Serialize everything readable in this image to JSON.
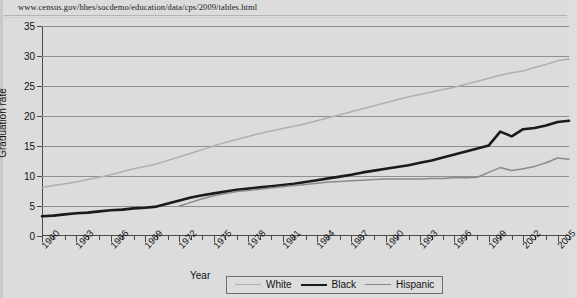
{
  "page": {
    "source_url": "www.census.gov/hhes/socdemo/education/data/cps/2009/tables.html"
  },
  "legend": {
    "white_label": "White",
    "black_label": "Black",
    "hispanic_label": "Hispanic"
  },
  "colors": {
    "white_series": "#b0b0b0",
    "black_series": "#1a1a1a",
    "hispanic_series": "#8a8a8a",
    "gridline": "#8f8f8f",
    "axis": "#4a4a4a",
    "background": "#dcdcdc"
  },
  "chart_data": {
    "type": "line",
    "title": "",
    "xlabel": "Year",
    "ylabel": "Graduation rate",
    "xlim": [
      1960,
      2006
    ],
    "ylim": [
      0,
      35
    ],
    "ytick_labels": [
      "0",
      "5",
      "10",
      "15",
      "20",
      "25",
      "30",
      "35"
    ],
    "ytick_values": [
      0,
      5,
      10,
      15,
      20,
      25,
      30,
      35
    ],
    "xtick_labels": [
      "1960",
      "1963",
      "1966",
      "1969",
      "1972",
      "1975",
      "1978",
      "1981",
      "1984",
      "1987",
      "1990",
      "1993",
      "1996",
      "1999",
      "2002",
      "2005"
    ],
    "xtick_values": [
      1960,
      1963,
      1966,
      1969,
      1972,
      1975,
      1978,
      1981,
      1984,
      1987,
      1990,
      1993,
      1996,
      1999,
      2002,
      2005
    ],
    "minor_ticks": "every year",
    "grid": "horizontal",
    "legend_position": "bottom",
    "series": [
      {
        "name": "White",
        "color": "#b0b0b0",
        "x": [
          1960,
          1961,
          1962,
          1963,
          1964,
          1965,
          1966,
          1967,
          1968,
          1969,
          1970,
          1971,
          1972,
          1973,
          1974,
          1975,
          1976,
          1977,
          1978,
          1979,
          1980,
          1981,
          1982,
          1983,
          1984,
          1985,
          1986,
          1987,
          1988,
          1989,
          1990,
          1991,
          1992,
          1993,
          1994,
          1995,
          1996,
          1997,
          1998,
          1999,
          2000,
          2001,
          2002,
          2003,
          2004,
          2005,
          2006
        ],
        "values": [
          8.1,
          8.4,
          8.7,
          9.0,
          9.4,
          9.8,
          10.2,
          10.7,
          11.2,
          11.6,
          12.0,
          12.6,
          13.2,
          13.8,
          14.4,
          15.0,
          15.6,
          16.1,
          16.6,
          17.1,
          17.5,
          17.9,
          18.3,
          18.7,
          19.2,
          19.7,
          20.2,
          20.7,
          21.2,
          21.7,
          22.2,
          22.7,
          23.2,
          23.6,
          24.0,
          24.4,
          24.8,
          25.3,
          25.8,
          26.3,
          26.8,
          27.2,
          27.5,
          28.1,
          28.6,
          29.2,
          29.5
        ]
      },
      {
        "name": "Black",
        "color": "#1a1a1a",
        "x": [
          1960,
          1961,
          1962,
          1963,
          1964,
          1965,
          1966,
          1967,
          1968,
          1969,
          1970,
          1971,
          1972,
          1973,
          1974,
          1975,
          1976,
          1977,
          1978,
          1979,
          1980,
          1981,
          1982,
          1983,
          1984,
          1985,
          1986,
          1987,
          1988,
          1989,
          1990,
          1991,
          1992,
          1993,
          1994,
          1995,
          1996,
          1997,
          1998,
          1999,
          2000,
          2001,
          2002,
          2003,
          2004,
          2005,
          2006
        ],
        "values": [
          3.3,
          3.4,
          3.6,
          3.8,
          3.9,
          4.1,
          4.3,
          4.4,
          4.6,
          4.7,
          4.9,
          5.4,
          5.9,
          6.4,
          6.8,
          7.1,
          7.4,
          7.7,
          7.9,
          8.1,
          8.3,
          8.5,
          8.7,
          9.0,
          9.3,
          9.6,
          9.9,
          10.2,
          10.6,
          10.9,
          11.2,
          11.5,
          11.8,
          12.2,
          12.6,
          13.1,
          13.6,
          14.1,
          14.6,
          15.1,
          17.4,
          16.6,
          17.8,
          18.0,
          18.4,
          19.0,
          19.2
        ]
      },
      {
        "name": "Hispanic",
        "color": "#8a8a8a",
        "x": [
          1972,
          1973,
          1974,
          1975,
          1976,
          1977,
          1978,
          1979,
          1980,
          1981,
          1982,
          1983,
          1984,
          1985,
          1986,
          1987,
          1988,
          1989,
          1990,
          1991,
          1992,
          1993,
          1994,
          1995,
          1996,
          1997,
          1998,
          1999,
          2000,
          2001,
          2002,
          2003,
          2004,
          2005,
          2006
        ],
        "values": [
          5.0,
          5.6,
          6.2,
          6.7,
          7.1,
          7.4,
          7.6,
          7.8,
          8.0,
          8.2,
          8.4,
          8.6,
          8.8,
          9.0,
          9.1,
          9.2,
          9.3,
          9.4,
          9.5,
          9.5,
          9.5,
          9.5,
          9.6,
          9.6,
          9.7,
          9.7,
          9.8,
          10.6,
          11.4,
          10.9,
          11.2,
          11.6,
          12.2,
          13.0,
          12.8
        ]
      }
    ]
  }
}
